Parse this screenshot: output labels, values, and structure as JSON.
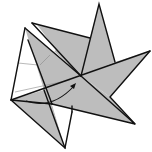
{
  "diagram": {
    "colors": {
      "paper_colored_side": "#bdbdbd",
      "paper_white_side": "#ffffff",
      "line": "#111111",
      "crease": "#8a8a8a"
    },
    "annotations": {
      "arrow": "curved fold arrow pointing toward center"
    }
  }
}
